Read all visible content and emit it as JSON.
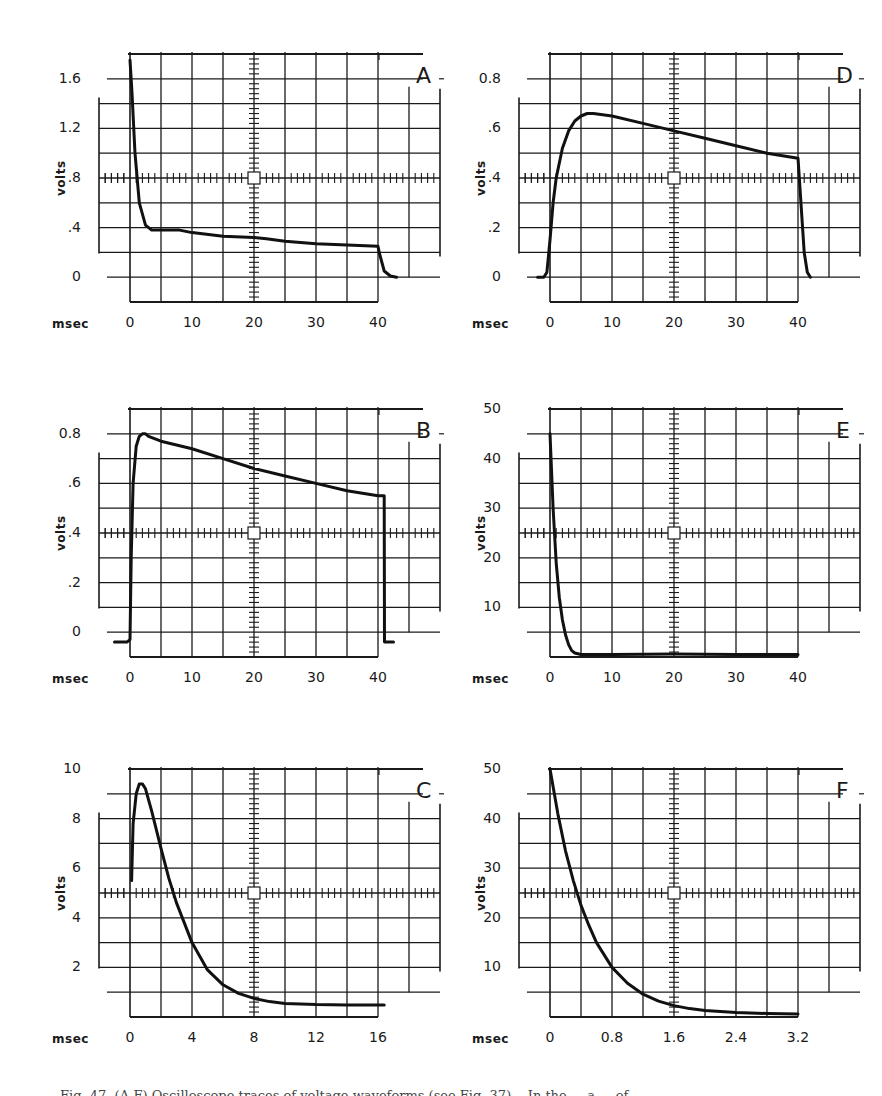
{
  "figure": {
    "caption_fragment": "Fig. 47. (A-F) Oscilloscope traces of voltage waveforms (see Fig. 37)... In the ... a ... of"
  },
  "chart_data": [
    {
      "id": "A",
      "type": "line",
      "title": "A",
      "xlabel": "msec",
      "ylabel": "volts",
      "x_ticks": [
        "0",
        "10",
        "20",
        "30",
        "40"
      ],
      "x_tick_values": [
        0,
        10,
        20,
        30,
        40
      ],
      "y_ticks": [
        "0",
        ".4",
        ".8",
        "1.2",
        "1.6"
      ],
      "y_tick_values": [
        0,
        0.4,
        0.8,
        1.2,
        1.6
      ],
      "xlim": [
        0,
        40
      ],
      "ylim": [
        0,
        1.6
      ],
      "grid": true,
      "x": [
        0,
        0.3,
        0.8,
        1.5,
        2.5,
        3.5,
        5,
        8,
        10,
        15,
        20,
        22,
        25,
        30,
        35,
        40,
        40.2,
        41,
        42,
        43
      ],
      "y": [
        1.75,
        1.5,
        1.0,
        0.6,
        0.42,
        0.38,
        0.38,
        0.38,
        0.36,
        0.33,
        0.32,
        0.31,
        0.29,
        0.27,
        0.26,
        0.25,
        0.2,
        0.05,
        0.01,
        0.0
      ]
    },
    {
      "id": "D",
      "type": "line",
      "title": "D",
      "xlabel": "msec",
      "ylabel": "volts",
      "x_ticks": [
        "0",
        "10",
        "20",
        "30",
        "40"
      ],
      "x_tick_values": [
        0,
        10,
        20,
        30,
        40
      ],
      "y_ticks": [
        "0",
        ".2",
        ".4",
        ".6",
        "0.8"
      ],
      "y_tick_values": [
        0,
        0.2,
        0.4,
        0.6,
        0.8
      ],
      "xlim": [
        0,
        40
      ],
      "ylim": [
        0,
        0.8
      ],
      "grid": true,
      "x": [
        -2,
        -1,
        -0.5,
        0,
        0.5,
        1,
        2,
        3,
        4,
        5,
        6,
        7,
        10,
        15,
        20,
        25,
        30,
        35,
        40,
        41,
        41.5,
        42
      ],
      "y": [
        0.0,
        0.0,
        0.02,
        0.15,
        0.3,
        0.4,
        0.52,
        0.59,
        0.63,
        0.65,
        0.66,
        0.66,
        0.65,
        0.62,
        0.59,
        0.56,
        0.53,
        0.5,
        0.48,
        0.1,
        0.02,
        0.0
      ]
    },
    {
      "id": "B",
      "type": "line",
      "title": "B",
      "xlabel": "msec",
      "ylabel": "volts",
      "x_ticks": [
        "0",
        "10",
        "20",
        "30",
        "40"
      ],
      "x_tick_values": [
        0,
        10,
        20,
        30,
        40
      ],
      "y_ticks": [
        "0",
        ".2",
        ".4",
        ".6",
        "0.8"
      ],
      "y_tick_values": [
        0,
        0.2,
        0.4,
        0.6,
        0.8
      ],
      "xlim": [
        0,
        40
      ],
      "ylim": [
        0,
        0.8
      ],
      "grid": true,
      "x": [
        -2.5,
        -0.5,
        0,
        0.2,
        0.5,
        1,
        1.5,
        2,
        2.5,
        3,
        5,
        10,
        15,
        20,
        25,
        30,
        35,
        40,
        41,
        41.05,
        42,
        42.5
      ],
      "y": [
        -0.04,
        -0.04,
        -0.03,
        0.3,
        0.6,
        0.75,
        0.79,
        0.8,
        0.8,
        0.79,
        0.77,
        0.74,
        0.7,
        0.66,
        0.63,
        0.6,
        0.57,
        0.55,
        0.55,
        -0.04,
        -0.04,
        -0.04
      ]
    },
    {
      "id": "E",
      "type": "line",
      "title": "E",
      "xlabel": "msec",
      "ylabel": "volts",
      "x_ticks": [
        "0",
        "10",
        "20",
        "30",
        "40"
      ],
      "x_tick_values": [
        0,
        10,
        20,
        30,
        40
      ],
      "y_ticks": [
        "10",
        "20",
        "30",
        "40",
        "50"
      ],
      "y_tick_values": [
        10,
        20,
        30,
        40,
        50
      ],
      "xlim": [
        0,
        40
      ],
      "ylim": [
        0,
        50
      ],
      "grid": true,
      "x": [
        0,
        0.5,
        1,
        1.5,
        2,
        2.5,
        3,
        3.5,
        4,
        5,
        10,
        20,
        30,
        40
      ],
      "y": [
        45,
        30,
        19,
        12,
        7.5,
        4.5,
        2.5,
        1.3,
        0.8,
        0.5,
        0.5,
        0.6,
        0.5,
        0.5
      ]
    },
    {
      "id": "C",
      "type": "line",
      "title": "C",
      "xlabel": "msec",
      "ylabel": "volts",
      "x_ticks": [
        "0",
        "4",
        "8",
        "12",
        "16"
      ],
      "x_tick_values": [
        0,
        4,
        8,
        12,
        16
      ],
      "y_ticks": [
        "2",
        "4",
        "6",
        "8",
        "10"
      ],
      "y_tick_values": [
        2,
        4,
        6,
        8,
        10
      ],
      "xlim": [
        0,
        16
      ],
      "ylim": [
        0,
        10
      ],
      "grid": true,
      "x": [
        0.1,
        0.2,
        0.4,
        0.6,
        0.8,
        1.0,
        1.4,
        2.0,
        2.5,
        3.0,
        4.0,
        5.0,
        6.0,
        7.0,
        8.0,
        9.0,
        10.0,
        12.0,
        14.0,
        16.0,
        16.4
      ],
      "y": [
        5.5,
        7.8,
        9.0,
        9.4,
        9.4,
        9.2,
        8.3,
        6.8,
        5.6,
        4.6,
        3.0,
        1.9,
        1.3,
        0.95,
        0.75,
        0.62,
        0.55,
        0.5,
        0.48,
        0.48,
        0.48
      ]
    },
    {
      "id": "F",
      "type": "line",
      "title": "F",
      "xlabel": "msec",
      "ylabel": "volts",
      "x_ticks": [
        "0",
        "0.8",
        "1.6",
        "2.4",
        "3.2"
      ],
      "x_tick_values": [
        0,
        0.8,
        1.6,
        2.4,
        3.2
      ],
      "y_ticks": [
        "10",
        "20",
        "30",
        "40",
        "50"
      ],
      "y_tick_values": [
        10,
        20,
        30,
        40,
        50
      ],
      "xlim": [
        0,
        3.2
      ],
      "ylim": [
        0,
        50
      ],
      "grid": true,
      "x": [
        0,
        0.1,
        0.2,
        0.3,
        0.4,
        0.5,
        0.6,
        0.8,
        1.0,
        1.2,
        1.4,
        1.6,
        1.8,
        2.0,
        2.4,
        2.8,
        3.2
      ],
      "y": [
        50,
        41,
        33.5,
        27.5,
        22.5,
        18.5,
        15,
        10,
        6.8,
        4.6,
        3.2,
        2.3,
        1.7,
        1.3,
        0.9,
        0.7,
        0.6
      ]
    }
  ],
  "panels": [
    {
      "id": "A",
      "left": 0,
      "top": 0
    },
    {
      "id": "D",
      "left": 420,
      "top": 0
    },
    {
      "id": "B",
      "left": 0,
      "top": 355
    },
    {
      "id": "E",
      "left": 420,
      "top": 355
    },
    {
      "id": "C",
      "left": 0,
      "top": 715
    },
    {
      "id": "F",
      "left": 420,
      "top": 715
    }
  ]
}
